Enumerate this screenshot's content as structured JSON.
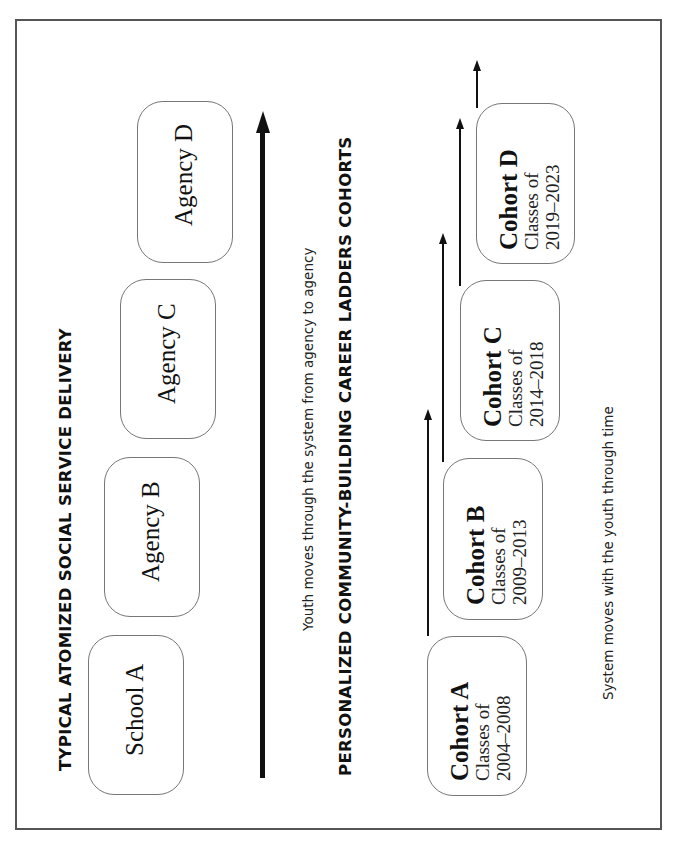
{
  "top_section": {
    "title": "TYPICAL ATOMIZED SOCIAL SERVICE DELIVERY",
    "boxes": [
      {
        "label": "School A"
      },
      {
        "label": "Agency B"
      },
      {
        "label": "Agency C"
      },
      {
        "label": "Agency D"
      }
    ],
    "caption": "Youth moves through the system from agency to agency"
  },
  "bottom_section": {
    "title": "PERSONALIZED COMMUNITY-BUILDING CAREER LADDERS COHORTS",
    "cohorts": [
      {
        "name": "Cohort A",
        "sub1": "Classes of",
        "sub2": "2004–2008"
      },
      {
        "name": "Cohort B",
        "sub1": "Classes of",
        "sub2": "2009–2013"
      },
      {
        "name": "Cohort C",
        "sub1": "Classes of",
        "sub2": "2014–2018"
      },
      {
        "name": "Cohort D",
        "sub1": "Classes of",
        "sub2": "2019–2023"
      }
    ],
    "caption": "System moves with the youth through time"
  },
  "colors": {
    "frame": "#555555",
    "box_border": "#777777",
    "arrow": "#111111",
    "text": "#111111"
  }
}
